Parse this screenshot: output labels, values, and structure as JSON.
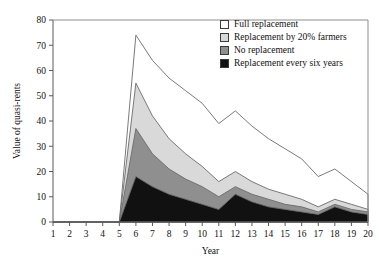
{
  "chart_data": {
    "type": "area",
    "stacked": true,
    "title": "",
    "xlabel": "Year",
    "ylabel": "Value of quasi-rents",
    "xlim": [
      1,
      20
    ],
    "ylim": [
      0,
      80
    ],
    "yticks": [
      0,
      10,
      20,
      30,
      40,
      50,
      60,
      70,
      80
    ],
    "xticks": [
      1,
      2,
      3,
      4,
      5,
      6,
      7,
      8,
      9,
      10,
      11,
      12,
      13,
      14,
      15,
      16,
      17,
      18,
      19,
      20
    ],
    "x": [
      1,
      2,
      3,
      4,
      5,
      6,
      7,
      8,
      9,
      10,
      11,
      12,
      13,
      14,
      15,
      16,
      17,
      18,
      19,
      20
    ],
    "grid": false,
    "legend_position": "top-right",
    "series": [
      {
        "name": "Full replacement",
        "color": "#ffffff",
        "cumulative_values": [
          0,
          0,
          0,
          0,
          0,
          74,
          64,
          57,
          52,
          47,
          39,
          44,
          38,
          33,
          29,
          25,
          18,
          21,
          16,
          11
        ]
      },
      {
        "name": "Replacement by 20% farmers",
        "color": "#d9d9d9",
        "cumulative_values": [
          0,
          0,
          0,
          0,
          0,
          55,
          42,
          33,
          27,
          22,
          16,
          20,
          16,
          13,
          11,
          9,
          6,
          9,
          7,
          5
        ]
      },
      {
        "name": "No replacement",
        "color": "#8f8f8f",
        "cumulative_values": [
          0,
          0,
          0,
          0,
          0,
          37,
          27,
          21,
          17,
          14,
          10,
          14,
          11,
          9,
          7,
          6,
          4,
          7,
          5,
          4
        ]
      },
      {
        "name": "Replacement every six years",
        "color": "#111111",
        "cumulative_values": [
          0,
          0,
          0,
          0,
          0,
          18,
          14,
          11,
          9,
          7,
          5,
          11,
          8,
          6,
          5,
          4,
          3,
          6,
          4,
          3
        ]
      }
    ]
  },
  "legend": {
    "items": [
      {
        "label": "Full replacement",
        "color": "#ffffff"
      },
      {
        "label": "Replacement by 20% farmers",
        "color": "#d9d9d9"
      },
      {
        "label": "No replacement",
        "color": "#8f8f8f"
      },
      {
        "label": "Replacement every six years",
        "color": "#111111"
      }
    ]
  }
}
